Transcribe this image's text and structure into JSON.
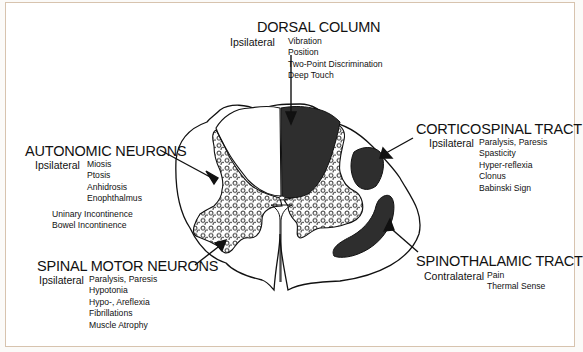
{
  "diagram": {
    "colors": {
      "tract_fill": "#2e2e2e",
      "outline": "#111111",
      "frame_border": "#d7c3ae",
      "background": "#ffffff"
    },
    "regions": {
      "dorsal_column": {
        "title": "DORSAL COLUMN",
        "laterality": "Ipsilateral",
        "findings": [
          "Vibration",
          "Position",
          "Two-Point Discrimination",
          "Deep Touch"
        ]
      },
      "autonomic_neurons": {
        "title": "AUTONOMIC NEURONS",
        "laterality": "Ipsilateral",
        "findings": [
          "Miosis",
          "Ptosis",
          "Anhidrosis",
          "Enophthalmus"
        ],
        "additional_findings": [
          "Uninary Incontinence",
          "Bowel Incontinence"
        ]
      },
      "corticospinal_tract": {
        "title": "CORTICOSPINAL TRACT",
        "laterality": "Ipsilateral",
        "findings": [
          "Paralysis, Paresis",
          "Spasticity",
          "Hyper-reflexia",
          "Clonus",
          "Babinski Sign"
        ]
      },
      "spinal_motor_neurons": {
        "title": "SPINAL MOTOR NEURONS",
        "laterality": "Ipsilateral",
        "findings": [
          "Paralysis, Paresis",
          "Hypotonia",
          "Hypo-, Areflexia",
          "Fibrillations",
          "Muscle Atrophy"
        ]
      },
      "spinothalamic_tract": {
        "title": "SPINOTHALAMIC TRACT",
        "laterality": "Contralateral",
        "findings": [
          "Pain",
          "Thermal Sense"
        ]
      }
    }
  }
}
